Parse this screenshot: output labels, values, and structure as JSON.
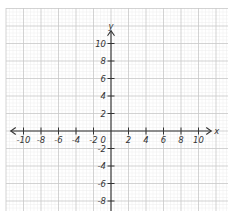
{
  "chart_data": {
    "type": "coordinate-plane",
    "title": "",
    "xlabel": "x",
    "ylabel": "y",
    "xlim": [
      -11,
      11
    ],
    "ylim": [
      -9,
      11
    ],
    "origin_label": "0",
    "x_ticks": [
      -10,
      -8,
      -6,
      -4,
      -2,
      2,
      4,
      6,
      8,
      10
    ],
    "x_tick_labels": [
      "-10",
      "-8",
      "-6",
      "-4",
      "-2",
      "2",
      "4",
      "6",
      "8",
      "10"
    ],
    "y_ticks": [
      10,
      8,
      6,
      4,
      2,
      -2,
      -4,
      -6,
      -8
    ],
    "y_tick_labels": [
      "10",
      "8",
      "6",
      "4",
      "2",
      "-2",
      "-4",
      "-6",
      "-8"
    ],
    "grid": true,
    "grid_minor_per_major": 5,
    "arrows": {
      "x_left": true,
      "x_right": true,
      "y_up": true,
      "y_down": false
    },
    "series": []
  },
  "colors": {
    "background": "#ffffff",
    "grid_minor": "#ececec",
    "grid_major": "#c8c8c8",
    "axis": "#333333",
    "label": "#333333"
  },
  "layout": {
    "origin_px": [
      111,
      131
    ],
    "unit_px": 8.75,
    "grid_left": 6,
    "grid_top": 8,
    "grid_right": 228,
    "grid_bottom": 211
  }
}
